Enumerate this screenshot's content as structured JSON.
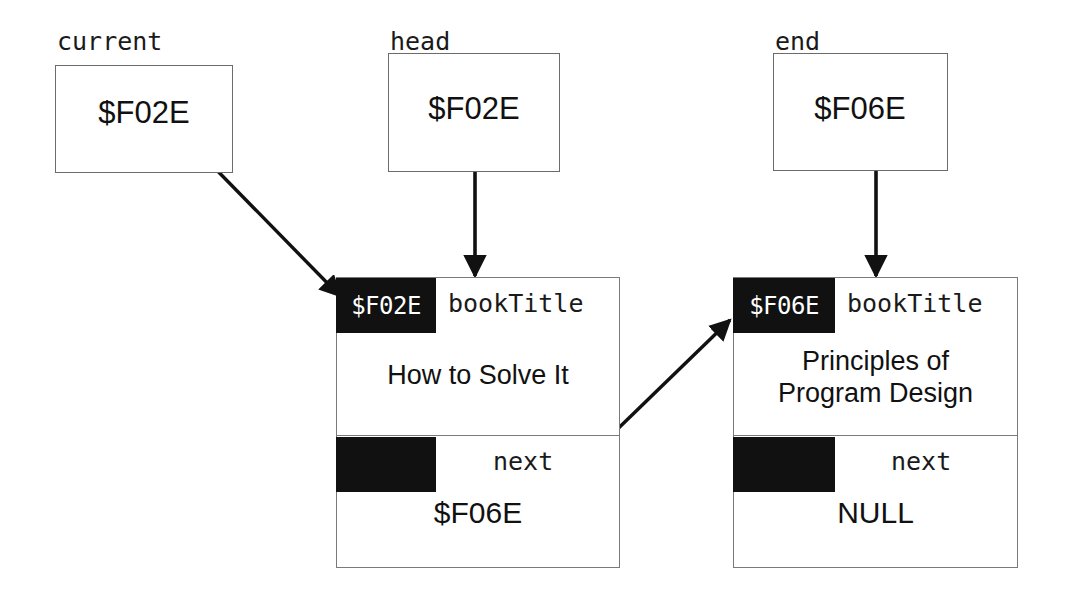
{
  "diagram": {
    "colors": {
      "ink": "#111111",
      "box_border": "#7a7a7a",
      "address_cell_bg": "#111111",
      "address_cell_fg": "#ffffff",
      "background": "#ffffff"
    }
  },
  "pointers": [
    {
      "label": "current",
      "value": "$F02E",
      "target": "node1-address-cell"
    },
    {
      "label": "head",
      "value": "$F02E",
      "target": "node1-address-cell"
    },
    {
      "label": "end",
      "value": "$F06E",
      "target": "node2-address-cell"
    }
  ],
  "nodes": [
    {
      "address": "$F02E",
      "fields": [
        {
          "name": "bookTitle",
          "value": "How  to Solve It"
        },
        {
          "name": "next",
          "value": "$F06E"
        }
      ]
    },
    {
      "address": "$F06E",
      "fields": [
        {
          "name": "bookTitle",
          "value": "Principles of\nProgram Design"
        },
        {
          "name": "next",
          "value": "NULL"
        }
      ]
    }
  ],
  "arrows": [
    {
      "from": "current-pointer-dot",
      "to": "node1-address-cell",
      "kind": "diagonal"
    },
    {
      "from": "head-pointer-dot",
      "to": "node1-address-cell",
      "kind": "vertical"
    },
    {
      "from": "end-pointer-dot",
      "to": "node2-address-cell",
      "kind": "vertical"
    },
    {
      "from": "node1-next-dot",
      "to": "node2-address-cell",
      "kind": "diagonal"
    }
  ]
}
